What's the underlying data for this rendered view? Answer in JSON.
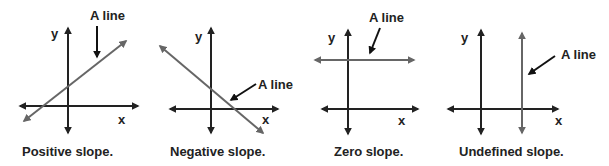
{
  "colors": {
    "axis": "#222222",
    "line": "#666666",
    "pointer": "#111111"
  },
  "panels": [
    {
      "id": "positive",
      "caption": "Positive slope.",
      "annotation": "A line",
      "x_label": "x",
      "y_label": "y"
    },
    {
      "id": "negative",
      "caption": "Negative slope.",
      "annotation": "A line",
      "x_label": "x",
      "y_label": "y"
    },
    {
      "id": "zero",
      "caption": "Zero slope.",
      "annotation": "A line",
      "x_label": "x",
      "y_label": "y"
    },
    {
      "id": "undefined",
      "caption": "Undefined slope.",
      "annotation": "A line",
      "x_label": "x",
      "y_label": "y"
    }
  ]
}
